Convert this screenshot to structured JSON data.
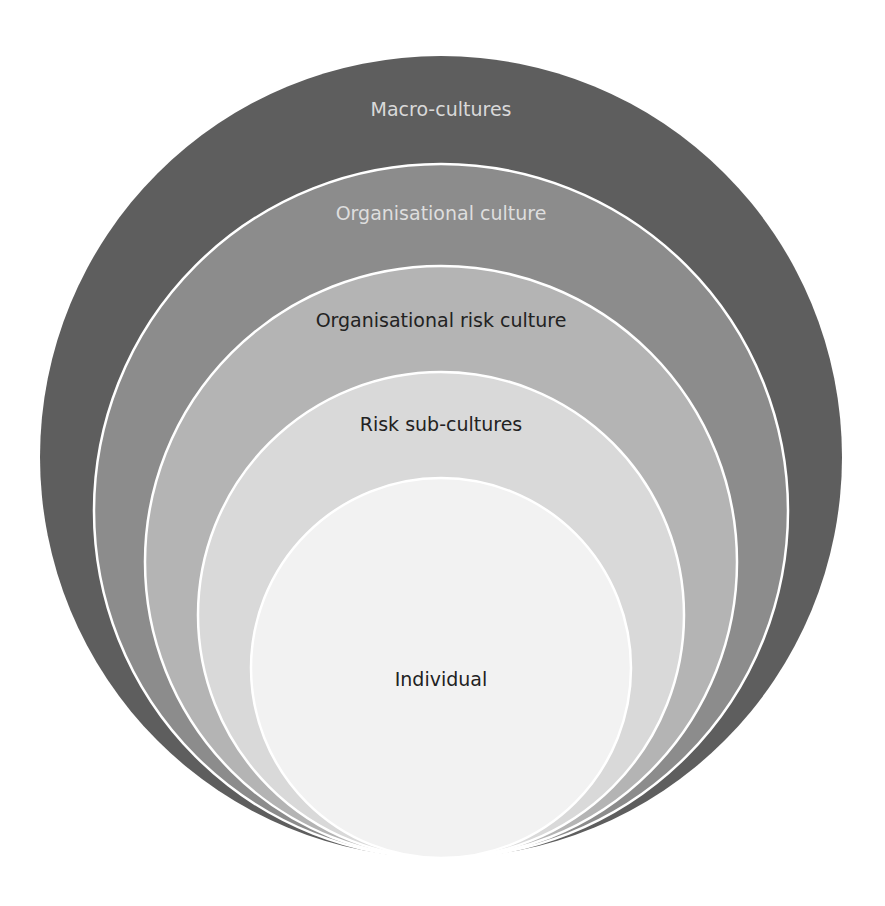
{
  "diagram": {
    "type": "nested-circles",
    "layers": [
      {
        "label": "Macro-cultures",
        "fill": "#5e5e5e",
        "text_color": "#d9d9d9",
        "cx": 441,
        "cy": 457,
        "r": 401,
        "label_y": 116
      },
      {
        "label": "Organisational culture",
        "fill": "#8c8c8c",
        "text_color": "#dedede",
        "cx": 441,
        "cy": 511,
        "r": 347,
        "label_y": 220
      },
      {
        "label": "Organisational risk culture",
        "fill": "#b4b4b4",
        "text_color": "#222222",
        "cx": 441,
        "cy": 562,
        "r": 296,
        "label_y": 327
      },
      {
        "label": "Risk sub-cultures",
        "fill": "#d9d9d9",
        "text_color": "#222222",
        "cx": 441,
        "cy": 615,
        "r": 243,
        "label_y": 431
      },
      {
        "label": "Individual",
        "fill": "#f2f2f2",
        "text_color": "#222222",
        "cx": 441,
        "cy": 668,
        "r": 190,
        "label_y": 686
      }
    ],
    "separator_color": "#ffffff"
  }
}
